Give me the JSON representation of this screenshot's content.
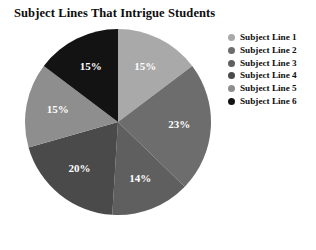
{
  "chart_data": {
    "type": "pie",
    "title": "Subject Lines That Intrigue Students",
    "xlabel": "",
    "ylabel": "",
    "legend_position": "right",
    "grid": false,
    "start_angle_deg": 0,
    "direction": "clockwise",
    "categories": [
      "Subject Line 1",
      "Subject Line 2",
      "Subject Line 3",
      "Subject Line 4",
      "Subject Line 5",
      "Subject Line 6"
    ],
    "values": [
      15,
      23,
      14,
      20,
      15,
      15
    ],
    "data_labels": [
      "15%",
      "23%",
      "14%",
      "20%",
      "15%",
      "15%"
    ],
    "colors": [
      "#a9a9a9",
      "#6d6d6d",
      "#5f5f5f",
      "#4a4a4a",
      "#8e8e8e",
      "#131313"
    ],
    "label_color": "#ffffff"
  },
  "legend": {
    "items": [
      {
        "label": "Subject Line 1",
        "color": "#a9a9a9"
      },
      {
        "label": "Subject Line 2",
        "color": "#6d6d6d"
      },
      {
        "label": "Subject Line 3",
        "color": "#5f5f5f"
      },
      {
        "label": "Subject Line 4",
        "color": "#4a4a4a"
      },
      {
        "label": "Subject Line 5",
        "color": "#8e8e8e"
      },
      {
        "label": "Subject Line 6",
        "color": "#131313"
      }
    ]
  }
}
